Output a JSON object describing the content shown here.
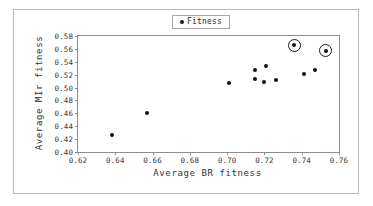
{
  "figure": {
    "has_outer_frame": true,
    "background_color": "#ffffff",
    "marker_color": "#111111",
    "axis_color": "#8d8d8d"
  },
  "legend": {
    "position": "top-center",
    "marker_icon": "diamond-dot-marker",
    "entries": [
      "Fitness"
    ]
  },
  "chart_data": {
    "type": "scatter",
    "title": "",
    "xlabel": "Average BR fitness",
    "ylabel": "Average MIr fitness",
    "xlim": [
      0.62,
      0.76
    ],
    "ylim": [
      0.4,
      0.58
    ],
    "xticks": [
      "0.62",
      "0.64",
      "0.66",
      "0.68",
      "0.70",
      "0.72",
      "0.74",
      "0.76"
    ],
    "yticks": [
      "0.40",
      "0.42",
      "0.44",
      "0.46",
      "0.48",
      "0.50",
      "0.52",
      "0.54",
      "0.56",
      "0.58"
    ],
    "grid": false,
    "legend": [
      "Fitness"
    ],
    "legend_position": "top-center",
    "series": [
      {
        "name": "Fitness",
        "marker": "filled-circle",
        "points": [
          {
            "x": 0.638,
            "y": 0.426,
            "highlighted": false
          },
          {
            "x": 0.657,
            "y": 0.461,
            "highlighted": false
          },
          {
            "x": 0.701,
            "y": 0.507,
            "highlighted": false
          },
          {
            "x": 0.715,
            "y": 0.528,
            "highlighted": false
          },
          {
            "x": 0.715,
            "y": 0.514,
            "highlighted": false
          },
          {
            "x": 0.721,
            "y": 0.533,
            "highlighted": false
          },
          {
            "x": 0.72,
            "y": 0.508,
            "highlighted": false
          },
          {
            "x": 0.726,
            "y": 0.512,
            "highlighted": false
          },
          {
            "x": 0.741,
            "y": 0.521,
            "highlighted": false
          },
          {
            "x": 0.747,
            "y": 0.528,
            "highlighted": false
          },
          {
            "x": 0.736,
            "y": 0.566,
            "highlighted": true
          },
          {
            "x": 0.753,
            "y": 0.557,
            "highlighted": true
          }
        ]
      }
    ],
    "annotations": [
      {
        "type": "circle-highlight",
        "x": 0.736,
        "y": 0.566
      },
      {
        "type": "circle-highlight",
        "x": 0.753,
        "y": 0.557
      }
    ]
  }
}
